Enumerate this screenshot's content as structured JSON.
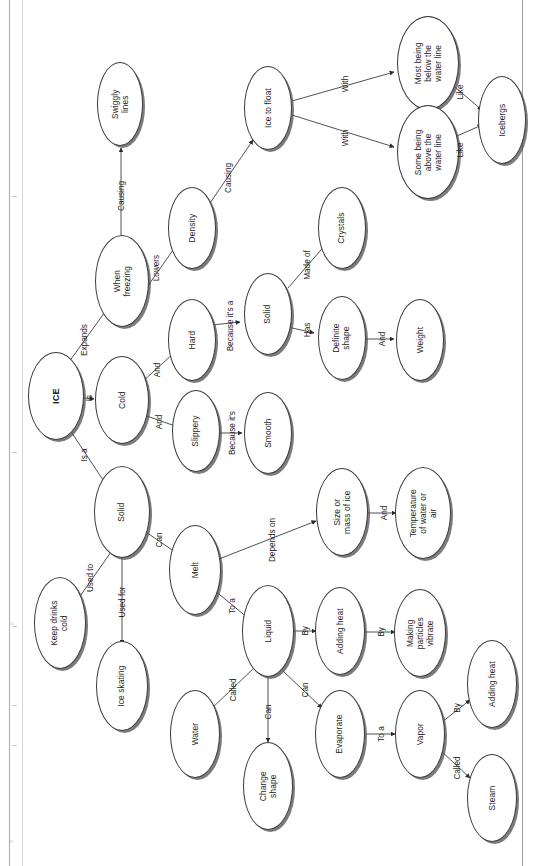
{
  "document": {
    "title": "ICE concept map",
    "orientation": "text rotated 90 degrees counter-clockwise (landscape scan)",
    "background_color": "#ffffff",
    "node_outline_color": "#3a3a3a",
    "node_shadow_color": "#555555",
    "text_color": "#1d1d1d"
  },
  "nodes": [
    {
      "id": "ice",
      "label": "ICE",
      "x": 56,
      "y": 396,
      "w": 56,
      "h": 88,
      "bold": true
    },
    {
      "id": "cold",
      "label": "Cold",
      "x": 122,
      "y": 400,
      "w": 54,
      "h": 88,
      "bold": false
    },
    {
      "id": "whenfreezing",
      "label": "When\nfreezing",
      "x": 122,
      "y": 281,
      "w": 54,
      "h": 92,
      "bold": false
    },
    {
      "id": "swiggly",
      "label": "Swiggly\nlines",
      "x": 120,
      "y": 104,
      "w": 46,
      "h": 84,
      "bold": false
    },
    {
      "id": "density",
      "label": "Density",
      "x": 192,
      "y": 228,
      "w": 48,
      "h": 82,
      "bold": false
    },
    {
      "id": "icetofloat",
      "label": "Ice to float",
      "x": 268,
      "y": 108,
      "w": 48,
      "h": 84,
      "bold": false
    },
    {
      "id": "mostbelow",
      "label": "Most being\nbelow the\nwater line",
      "x": 428,
      "y": 63,
      "w": 62,
      "h": 94,
      "bold": false
    },
    {
      "id": "someabove",
      "label": "Some being\nabove the\nwater line",
      "x": 428,
      "y": 152,
      "w": 62,
      "h": 94,
      "bold": false
    },
    {
      "id": "icebergs",
      "label": "Icebergs",
      "x": 502,
      "y": 120,
      "w": 48,
      "h": 88,
      "bold": false
    },
    {
      "id": "hard",
      "label": "Hard",
      "x": 192,
      "y": 340,
      "w": 48,
      "h": 82,
      "bold": false
    },
    {
      "id": "solid1",
      "label": "Solid",
      "x": 268,
      "y": 314,
      "w": 48,
      "h": 82,
      "bold": false
    },
    {
      "id": "crystals",
      "label": "Crystals",
      "x": 342,
      "y": 228,
      "w": 48,
      "h": 82,
      "bold": false
    },
    {
      "id": "definite",
      "label": "Definite\nshape",
      "x": 342,
      "y": 338,
      "w": 48,
      "h": 84,
      "bold": false
    },
    {
      "id": "weight",
      "label": "Weight",
      "x": 420,
      "y": 340,
      "w": 48,
      "h": 82,
      "bold": false
    },
    {
      "id": "slippery",
      "label": "Slippery",
      "x": 196,
      "y": 431,
      "w": 48,
      "h": 82,
      "bold": false
    },
    {
      "id": "smooth",
      "label": "Smooth",
      "x": 268,
      "y": 433,
      "w": 48,
      "h": 82,
      "bold": false
    },
    {
      "id": "solid2",
      "label": "Solid",
      "x": 122,
      "y": 512,
      "w": 56,
      "h": 92,
      "bold": false
    },
    {
      "id": "melt",
      "label": "Melt",
      "x": 195,
      "y": 570,
      "w": 52,
      "h": 90,
      "bold": false
    },
    {
      "id": "sizemass",
      "label": "Size or\nmass of ice",
      "x": 342,
      "y": 512,
      "w": 52,
      "h": 88,
      "bold": false
    },
    {
      "id": "temperature",
      "label": "Temperature\nof water or\nair",
      "x": 423,
      "y": 513,
      "w": 56,
      "h": 92,
      "bold": false
    },
    {
      "id": "liquid",
      "label": "Liquid",
      "x": 268,
      "y": 631,
      "w": 52,
      "h": 92,
      "bold": false
    },
    {
      "id": "addingheat1",
      "label": "Adding heat",
      "x": 340,
      "y": 631,
      "w": 50,
      "h": 88,
      "bold": false
    },
    {
      "id": "vibrate",
      "label": "Making\nparticles\nvibrate",
      "x": 420,
      "y": 633,
      "w": 52,
      "h": 88,
      "bold": false
    },
    {
      "id": "keepdrinks",
      "label": "Keep drinks\ncold",
      "x": 60,
      "y": 623,
      "w": 52,
      "h": 92,
      "bold": false
    },
    {
      "id": "iceskating",
      "label": "Ice skating",
      "x": 122,
      "y": 686,
      "w": 52,
      "h": 90,
      "bold": false
    },
    {
      "id": "water",
      "label": "Water",
      "x": 195,
      "y": 734,
      "w": 50,
      "h": 88,
      "bold": false
    },
    {
      "id": "changeshape",
      "label": "Change\nshape",
      "x": 268,
      "y": 786,
      "w": 50,
      "h": 88,
      "bold": false
    },
    {
      "id": "evaporate",
      "label": "Evaporate",
      "x": 340,
      "y": 734,
      "w": 50,
      "h": 88,
      "bold": false
    },
    {
      "id": "vapor",
      "label": "Vapor",
      "x": 420,
      "y": 734,
      "w": 50,
      "h": 88,
      "bold": false
    },
    {
      "id": "addingheat2",
      "label": "Adding heat",
      "x": 492,
      "y": 684,
      "w": 50,
      "h": 88,
      "bold": false
    },
    {
      "id": "steam",
      "label": "Steam",
      "x": 492,
      "y": 798,
      "w": 50,
      "h": 88,
      "bold": false
    }
  ],
  "edges": [
    {
      "from": "ice",
      "to": "cold",
      "label": "Is",
      "lx": 89,
      "ly": 398,
      "x1": 84,
      "y1": 398,
      "x2": 94,
      "y2": 399
    },
    {
      "from": "ice",
      "to": "whenfreezing",
      "label": "Expands",
      "lx": 84,
      "ly": 340,
      "x1": 66,
      "y1": 366,
      "x2": 110,
      "y2": 305
    },
    {
      "from": "ice",
      "to": "solid2",
      "label": "Is a",
      "lx": 84,
      "ly": 455,
      "x1": 66,
      "y1": 424,
      "x2": 107,
      "y2": 486
    },
    {
      "from": "whenfreezing",
      "to": "swiggly",
      "label": "Causing",
      "lx": 121,
      "ly": 196,
      "x1": 121,
      "y1": 235,
      "x2": 121,
      "y2": 148
    },
    {
      "from": "whenfreezing",
      "to": "density",
      "label": "Lowers",
      "lx": 156,
      "ly": 268,
      "x1": 140,
      "y1": 297,
      "x2": 178,
      "y2": 243
    },
    {
      "from": "density",
      "to": "icetofloat",
      "label": "Causing",
      "lx": 228,
      "ly": 178,
      "x1": 208,
      "y1": 206,
      "x2": 253,
      "y2": 140
    },
    {
      "from": "icetofloat",
      "to": "mostbelow",
      "label": "With",
      "lx": 345,
      "ly": 84,
      "x1": 292,
      "y1": 101,
      "x2": 394,
      "y2": 72
    },
    {
      "from": "icetofloat",
      "to": "someabove",
      "label": "With",
      "lx": 345,
      "ly": 138,
      "x1": 292,
      "y1": 115,
      "x2": 394,
      "y2": 147
    },
    {
      "from": "mostbelow",
      "to": "icebergs",
      "label": "Like",
      "lx": 460,
      "ly": 92,
      "x1": 450,
      "y1": 83,
      "x2": 482,
      "y2": 110
    },
    {
      "from": "someabove",
      "to": "icebergs",
      "label": "Like",
      "lx": 460,
      "ly": 150,
      "x1": 450,
      "y1": 139,
      "x2": 482,
      "y2": 125
    },
    {
      "from": "cold",
      "to": "hard",
      "label": "And",
      "lx": 157,
      "ly": 370,
      "x1": 141,
      "y1": 383,
      "x2": 175,
      "y2": 352
    },
    {
      "from": "cold",
      "to": "slippery",
      "label": "And",
      "lx": 159,
      "ly": 422,
      "x1": 141,
      "y1": 414,
      "x2": 178,
      "y2": 427
    },
    {
      "from": "hard",
      "to": "solid1",
      "label": "Because it's a",
      "lx": 230,
      "ly": 326,
      "x1": 212,
      "y1": 325,
      "x2": 240,
      "y2": 322
    },
    {
      "from": "solid1",
      "to": "crystals",
      "label": "Made of",
      "lx": 307,
      "ly": 265,
      "x1": 288,
      "y1": 288,
      "x2": 327,
      "y2": 243
    },
    {
      "from": "solid1",
      "to": "definite",
      "label": "Has",
      "lx": 307,
      "ly": 330,
      "x1": 288,
      "y1": 327,
      "x2": 314,
      "y2": 333
    },
    {
      "from": "definite",
      "to": "weight",
      "label": "And",
      "lx": 382,
      "ly": 339,
      "x1": 364,
      "y1": 339,
      "x2": 394,
      "y2": 339
    },
    {
      "from": "slippery",
      "to": "smooth",
      "label": "Because it's",
      "lx": 232,
      "ly": 433,
      "x1": 218,
      "y1": 433,
      "x2": 242,
      "y2": 433
    },
    {
      "from": "solid2",
      "to": "melt",
      "label": "Can",
      "lx": 159,
      "ly": 540,
      "x1": 140,
      "y1": 528,
      "x2": 178,
      "y2": 554
    },
    {
      "from": "solid2",
      "to": "keepdrinks",
      "label": "Used to",
      "lx": 90,
      "ly": 578,
      "x1": 111,
      "y1": 552,
      "x2": 76,
      "y2": 602
    },
    {
      "from": "solid2",
      "to": "iceskating",
      "label": "Used for",
      "lx": 122,
      "ly": 602,
      "x1": 122,
      "y1": 558,
      "x2": 122,
      "y2": 644
    },
    {
      "from": "melt",
      "to": "sizemass",
      "label": "Depends on",
      "lx": 272,
      "ly": 540,
      "x1": 219,
      "y1": 559,
      "x2": 316,
      "y2": 521
    },
    {
      "from": "melt",
      "to": "liquid",
      "label": "To a",
      "lx": 232,
      "ly": 606,
      "x1": 214,
      "y1": 590,
      "x2": 248,
      "y2": 618
    },
    {
      "from": "sizemass",
      "to": "temperature",
      "label": "And",
      "lx": 384,
      "ly": 513,
      "x1": 368,
      "y1": 513,
      "x2": 396,
      "y2": 513
    },
    {
      "from": "liquid",
      "to": "addingheat1",
      "label": "By",
      "lx": 305,
      "ly": 631,
      "x1": 294,
      "y1": 631,
      "x2": 316,
      "y2": 631
    },
    {
      "from": "addingheat1",
      "to": "vibrate",
      "label": "By",
      "lx": 381,
      "ly": 632,
      "x1": 365,
      "y1": 632,
      "x2": 395,
      "y2": 632
    },
    {
      "from": "liquid",
      "to": "water",
      "label": "Called",
      "lx": 233,
      "ly": 690,
      "x1": 254,
      "y1": 668,
      "x2": 210,
      "y2": 710
    },
    {
      "from": "liquid",
      "to": "changeshape",
      "label": "Can",
      "lx": 268,
      "ly": 712,
      "x1": 268,
      "y1": 677,
      "x2": 268,
      "y2": 742
    },
    {
      "from": "liquid",
      "to": "evaporate",
      "label": "Can",
      "lx": 305,
      "ly": 690,
      "x1": 283,
      "y1": 671,
      "x2": 322,
      "y2": 708
    },
    {
      "from": "evaporate",
      "to": "vapor",
      "label": "To a",
      "lx": 381,
      "ly": 734,
      "x1": 366,
      "y1": 734,
      "x2": 395,
      "y2": 734
    },
    {
      "from": "vapor",
      "to": "addingheat2",
      "label": "By",
      "lx": 457,
      "ly": 708,
      "x1": 442,
      "y1": 722,
      "x2": 470,
      "y2": 700
    },
    {
      "from": "vapor",
      "to": "steam",
      "label": "Called",
      "lx": 457,
      "ly": 768,
      "x1": 440,
      "y1": 750,
      "x2": 470,
      "y2": 778
    }
  ]
}
